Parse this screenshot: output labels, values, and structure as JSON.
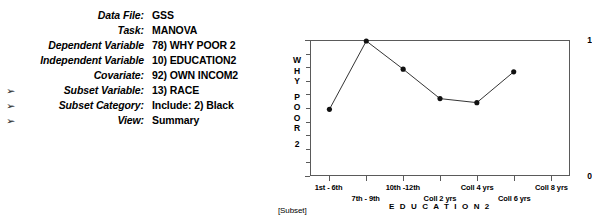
{
  "params": {
    "rows": [
      {
        "arrow": "",
        "label": "Data File:",
        "value": "GSS"
      },
      {
        "arrow": "",
        "label": "Task:",
        "value": "MANOVA"
      },
      {
        "arrow": "",
        "label": "Dependent Variable",
        "value": "78) WHY POOR 2"
      },
      {
        "arrow": "",
        "label": "Independent Variable",
        "value": "10) EDUCATION2"
      },
      {
        "arrow": "",
        "label": "Covariate:",
        "value": "92) OWN INCOM2"
      },
      {
        "arrow": "➢",
        "label": "Subset Variable:",
        "value": "13) RACE"
      },
      {
        "arrow": "➢",
        "label": "Subset Category:",
        "value": "Include: 2) Black"
      },
      {
        "arrow": "➢",
        "label": "View:",
        "value": "Summary"
      }
    ]
  },
  "chart_data": {
    "type": "line",
    "title": "",
    "xlabel": "E D U C A T I O N 2",
    "ylabel": "WHY POOR 2",
    "ylabel_chars": [
      "W",
      "H",
      "Y",
      "P",
      "O",
      "O",
      "R",
      "2"
    ],
    "categories": [
      "1st - 6th",
      "7th - 9th",
      "10th -12th",
      "Coll 2 yrs",
      "Coll 4 yrs",
      "Coll 6 yrs",
      "Coll 8 yrs"
    ],
    "values": [
      0.49,
      1.0,
      0.79,
      0.57,
      0.54,
      0.77,
      null
    ],
    "ylim": [
      0,
      1
    ],
    "ytick_values": [
      0,
      1
    ],
    "ytick_labels": [
      "0",
      "1"
    ],
    "grid": false,
    "legend": false,
    "marker": "filled-circle",
    "footnote": "[Subset]"
  }
}
